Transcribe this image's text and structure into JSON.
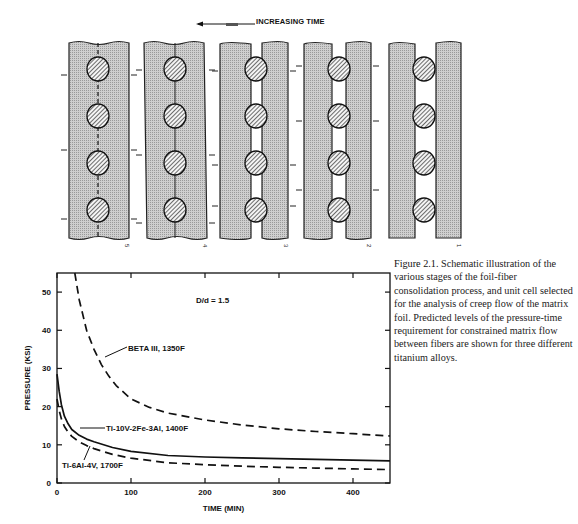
{
  "diagram": {
    "arrow_label": "INCREASING TIME",
    "stages": [
      "5",
      "4",
      "3",
      "2",
      "1"
    ],
    "matrix_color": "#c8c8c8",
    "fiber_hatch": "diagonal"
  },
  "caption": {
    "figure_label": "Figure 2.1.",
    "text": "Schematic illustration of the various stages of the foil-fiber consolidation process, and unit cell selected for the analysis of creep flow of the matrix foil. Predicted levels of the pressure-time requirement for constrained matrix flow between fibers are shown for three different titanium alloys."
  },
  "chart_data": {
    "type": "line",
    "title": "",
    "annotation": "D/d = 1.5",
    "xlabel": "TIME (MIN)",
    "ylabel": "PRESSURE (KSI)",
    "xlim": [
      0,
      450
    ],
    "ylim": [
      0,
      55
    ],
    "xticks": [
      0,
      100,
      200,
      300,
      400
    ],
    "yticks": [
      0,
      10,
      20,
      30,
      40,
      50
    ],
    "grid": false,
    "legend": "inline labels with leader arrows",
    "series": [
      {
        "name": "BETA III, 1350F",
        "style": "dashed",
        "x": [
          24,
          30,
          40,
          50,
          60,
          70,
          80,
          100,
          125,
          150,
          200,
          250,
          300,
          350,
          400,
          450
        ],
        "y": [
          55,
          48,
          40,
          35,
          31,
          28,
          25.5,
          22,
          19.8,
          18.3,
          16.5,
          15.2,
          14.2,
          13.5,
          12.9,
          12.3
        ]
      },
      {
        "name": "Ti-10V-2Fe-3Al, 1400F",
        "style": "solid",
        "x": [
          0,
          3,
          6,
          10,
          15,
          20,
          30,
          40,
          50,
          75,
          100,
          150,
          200,
          250,
          300,
          350,
          400,
          450
        ],
        "y": [
          28.5,
          24,
          20.5,
          17.5,
          15.5,
          14,
          12.5,
          11.5,
          10.8,
          9.3,
          8.3,
          7.2,
          6.8,
          6.6,
          6.4,
          6.2,
          6.0,
          5.8
        ]
      },
      {
        "name": "Ti-6Al-4V, 1700F",
        "style": "dashed",
        "x": [
          0,
          3,
          6,
          10,
          15,
          20,
          30,
          40,
          50,
          75,
          100,
          150,
          200,
          250,
          300,
          350,
          400,
          450
        ],
        "y": [
          22,
          19,
          16.8,
          14.8,
          13.3,
          12.2,
          10.8,
          9.8,
          9.0,
          7.5,
          6.5,
          5.3,
          4.8,
          4.4,
          4.1,
          3.9,
          3.7,
          3.5
        ]
      }
    ]
  }
}
